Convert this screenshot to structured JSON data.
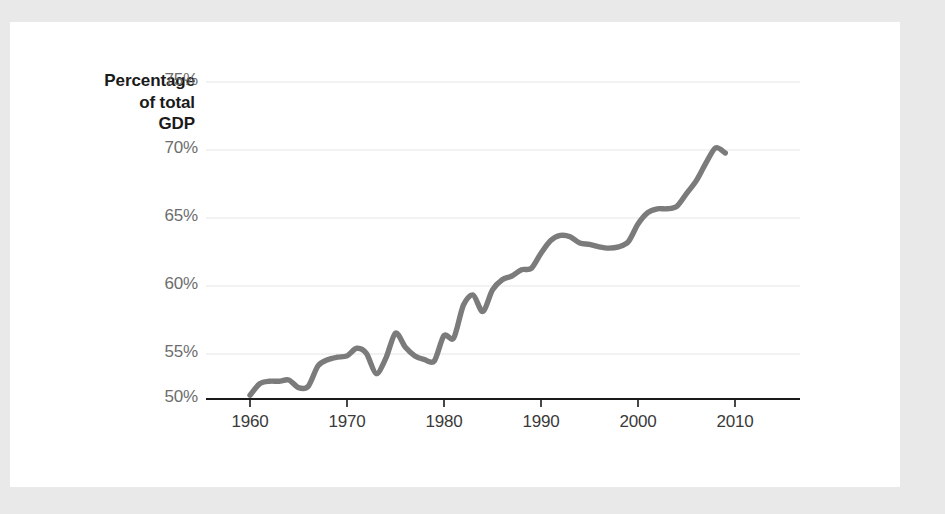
{
  "figure": {
    "background_color": "#e9e9e9",
    "card_color": "#ffffff",
    "line_color": "#7b7b7b",
    "gridline_color": "#eeeeee",
    "axis_color": "#1a1a1a",
    "tick_label_color": "#6d6d6d"
  },
  "chart_data": {
    "type": "line",
    "title": "",
    "subtitle": "",
    "xlabel": "",
    "ylabel": "Percentage of total GDP",
    "ylabel_lines": [
      "Percentage",
      "of total",
      "GDP"
    ],
    "xlim": [
      1960,
      2010
    ],
    "ylim": [
      50,
      75
    ],
    "grid": true,
    "grid_axis": "y",
    "legend": false,
    "legend_position": "none",
    "yticks": [
      50,
      55,
      60,
      65,
      70,
      75
    ],
    "ytick_labels": [
      "50%",
      "55%",
      "60%",
      "65%",
      "70%",
      "75%"
    ],
    "xticks": [
      1960,
      1970,
      1980,
      1990,
      2000,
      2010
    ],
    "xtick_labels": [
      "1960",
      "1970",
      "1980",
      "1990",
      "2000",
      "2010"
    ],
    "series": [
      {
        "name": "Consumer spending share of GDP",
        "x": [
          1960,
          1961,
          1962,
          1963,
          1964,
          1965,
          1966,
          1967,
          1968,
          1969,
          1970,
          1971,
          1972,
          1973,
          1974,
          1975,
          1976,
          1977,
          1978,
          1979,
          1980,
          1981,
          1982,
          1983,
          1984,
          1985,
          1986,
          1987,
          1988,
          1989,
          1990,
          1991,
          1992,
          1993,
          1994,
          1995,
          1996,
          1997,
          1998,
          1999,
          2000,
          2001,
          2002,
          2003,
          2004,
          2005,
          2006,
          2007,
          2008,
          2009
        ],
        "values": [
          50.3,
          51.2,
          51.4,
          51.4,
          51.5,
          50.9,
          51.0,
          52.6,
          53.1,
          53.3,
          53.4,
          54.0,
          53.6,
          52.0,
          53.2,
          55.2,
          54.1,
          53.4,
          53.1,
          53.0,
          55.0,
          54.8,
          57.4,
          58.2,
          56.9,
          58.6,
          59.4,
          59.7,
          60.2,
          60.3,
          61.5,
          62.5,
          62.9,
          62.8,
          62.3,
          62.2,
          62.0,
          61.9,
          62.0,
          62.4,
          63.8,
          64.7,
          65.0,
          65.0,
          65.2,
          66.2,
          67.2,
          68.6,
          69.8,
          69.4
        ]
      }
    ],
    "annotations": []
  }
}
